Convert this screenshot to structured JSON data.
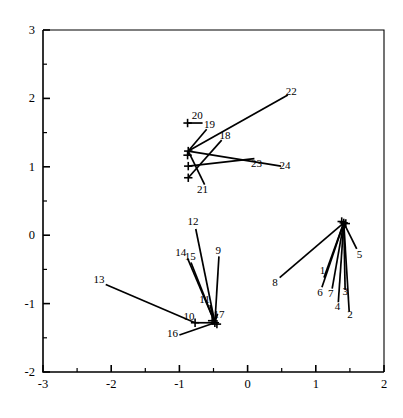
{
  "chart_data": {
    "type": "scatter",
    "title": "",
    "xlabel": "",
    "ylabel": "",
    "xlim": [
      -3,
      2
    ],
    "ylim": [
      -2,
      3
    ],
    "grid": false,
    "legend": null,
    "xticks": [
      "-3",
      "-2",
      "-1",
      "0",
      "1",
      "2"
    ],
    "xtick_values": [
      -3,
      -2,
      -1,
      0,
      1,
      2
    ],
    "yticks": [
      "-2",
      "-1",
      "0",
      "1",
      "2",
      "3"
    ],
    "ytick_values": [
      -2,
      -1,
      0,
      1,
      2,
      3
    ],
    "minor_tick_step": 0.5,
    "clusters": [
      {
        "name": "right-cluster",
        "x": 1.41,
        "y": 0.18
      },
      {
        "name": "lower-cluster",
        "x": -0.48,
        "y": -1.28
      },
      {
        "name": "upper-cluster",
        "x": -0.87,
        "y": 1.23
      }
    ],
    "markers": [
      {
        "x": 1.41,
        "y": 0.18
      },
      {
        "x": 1.38,
        "y": 0.2
      },
      {
        "x": 1.44,
        "y": 0.17
      },
      {
        "x": -0.48,
        "y": -1.28
      },
      {
        "x": -0.52,
        "y": -1.25
      },
      {
        "x": -0.45,
        "y": -1.3
      },
      {
        "x": -0.77,
        "y": -1.28
      },
      {
        "x": -0.87,
        "y": 1.23
      },
      {
        "x": -0.88,
        "y": 1.17
      },
      {
        "x": -0.87,
        "y": 1.01
      },
      {
        "x": -0.87,
        "y": 0.84
      },
      {
        "x": -0.88,
        "y": 1.64
      }
    ],
    "vectors": [
      {
        "label": "1",
        "x1": 1.41,
        "y1": 0.18,
        "x2": 1.12,
        "y2": -0.62,
        "lx": 1.1,
        "ly": -0.53
      },
      {
        "label": "2",
        "x1": 1.41,
        "y1": 0.18,
        "x2": 1.49,
        "y2": -1.12,
        "lx": 1.5,
        "ly": -1.17
      },
      {
        "label": "3",
        "x1": 1.41,
        "y1": 0.18,
        "x2": 1.43,
        "y2": -0.8,
        "lx": 1.43,
        "ly": -0.84
      },
      {
        "label": "4",
        "x1": 1.41,
        "y1": 0.18,
        "x2": 1.33,
        "y2": -0.98,
        "lx": 1.32,
        "ly": -1.05
      },
      {
        "label": "5",
        "x1": 1.41,
        "y1": 0.18,
        "x2": 1.6,
        "y2": -0.2,
        "lx": 1.64,
        "ly": -0.3
      },
      {
        "label": "6",
        "x1": 1.41,
        "y1": 0.18,
        "x2": 1.09,
        "y2": -0.76,
        "lx": 1.06,
        "ly": -0.85
      },
      {
        "label": "7",
        "x1": 1.41,
        "y1": 0.18,
        "x2": 1.24,
        "y2": -0.78,
        "lx": 1.22,
        "ly": -0.86
      },
      {
        "label": "8",
        "x1": 1.41,
        "y1": 0.18,
        "x2": 0.47,
        "y2": -0.62,
        "lx": 0.4,
        "ly": -0.7
      },
      {
        "label": "9",
        "x1": -0.48,
        "y1": -1.28,
        "x2": -0.42,
        "y2": -0.31,
        "lx": -0.43,
        "ly": -0.24
      },
      {
        "label": "10",
        "x1": -0.48,
        "y1": -1.28,
        "x2": -0.77,
        "y2": -1.28,
        "lx": -0.86,
        "ly": -1.2
      },
      {
        "label": "11",
        "x1": -0.48,
        "y1": -1.28,
        "x2": -0.55,
        "y2": -1.02,
        "lx": -0.63,
        "ly": -0.96
      },
      {
        "label": "12",
        "x1": -0.48,
        "y1": -1.28,
        "x2": -0.76,
        "y2": 0.09,
        "lx": -0.8,
        "ly": 0.18
      },
      {
        "label": "13",
        "x1": -0.77,
        "y1": -1.28,
        "x2": -2.08,
        "y2": -0.72,
        "lx": -2.18,
        "ly": -0.66
      },
      {
        "label": "14",
        "x1": -0.48,
        "y1": -1.28,
        "x2": -0.88,
        "y2": -0.34,
        "lx": -0.98,
        "ly": -0.27
      },
      {
        "label": "15",
        "x1": -0.48,
        "y1": -1.28,
        "x2": -0.83,
        "y2": -0.4,
        "lx": -0.84,
        "ly": -0.33
      },
      {
        "label": "16",
        "x1": -0.48,
        "y1": -1.28,
        "x2": -1.0,
        "y2": -1.46,
        "lx": -1.1,
        "ly": -1.45
      },
      {
        "label": "17",
        "x1": -0.48,
        "y1": -1.28,
        "x2": -0.44,
        "y2": -1.15,
        "lx": -0.42,
        "ly": -1.17
      },
      {
        "label": "18",
        "x1": -0.87,
        "y1": 0.84,
        "x2": -0.38,
        "y2": 1.39,
        "lx": -0.33,
        "ly": 1.45
      },
      {
        "label": "19",
        "x1": -0.87,
        "y1": 1.23,
        "x2": -0.6,
        "y2": 1.55,
        "lx": -0.56,
        "ly": 1.6
      },
      {
        "label": "20",
        "x1": -0.88,
        "y1": 1.64,
        "x2": -0.66,
        "y2": 1.64,
        "lx": -0.74,
        "ly": 1.74
      },
      {
        "label": "21",
        "x1": -0.87,
        "y1": 1.23,
        "x2": -0.63,
        "y2": 0.74,
        "lx": -0.66,
        "ly": 0.66
      },
      {
        "label": "22",
        "x1": -0.87,
        "y1": 1.23,
        "x2": 0.59,
        "y2": 2.05,
        "lx": 0.64,
        "ly": 2.09
      },
      {
        "label": "23",
        "x1": -0.87,
        "y1": 1.01,
        "x2": 0.1,
        "y2": 1.12,
        "lx": 0.13,
        "ly": 1.03
      },
      {
        "label": "24",
        "x1": -0.87,
        "y1": 1.23,
        "x2": 0.49,
        "y2": 1.01,
        "lx": 0.55,
        "ly": 1.0
      }
    ]
  },
  "plot": {
    "axis": {
      "x_min_label": "-3",
      "x_max_label": "2",
      "y_min_label": "-2",
      "y_max_label": "3"
    }
  }
}
